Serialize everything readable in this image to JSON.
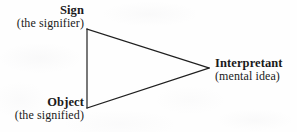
{
  "diagram": {
    "type": "semiotic-triangle",
    "background_color": "#fefefe",
    "line_color": "#1f1f1f",
    "text_color": "#1a1a1a",
    "nodes": [
      {
        "id": "sign",
        "title": "Sign",
        "subtitle": "(the signifier)",
        "vertex": {
          "x": 87,
          "y": 29
        },
        "label_align": "right"
      },
      {
        "id": "object",
        "title": "Object",
        "subtitle": "(the signified)",
        "vertex": {
          "x": 87,
          "y": 108
        },
        "label_align": "right"
      },
      {
        "id": "interpretant",
        "title": "Interpretant",
        "subtitle": "(mental idea)",
        "vertex": {
          "x": 209,
          "y": 68
        },
        "label_align": "left"
      }
    ],
    "edges": [
      {
        "from": "sign",
        "to": "object"
      },
      {
        "from": "sign",
        "to": "interpretant"
      },
      {
        "from": "object",
        "to": "interpretant"
      }
    ]
  }
}
